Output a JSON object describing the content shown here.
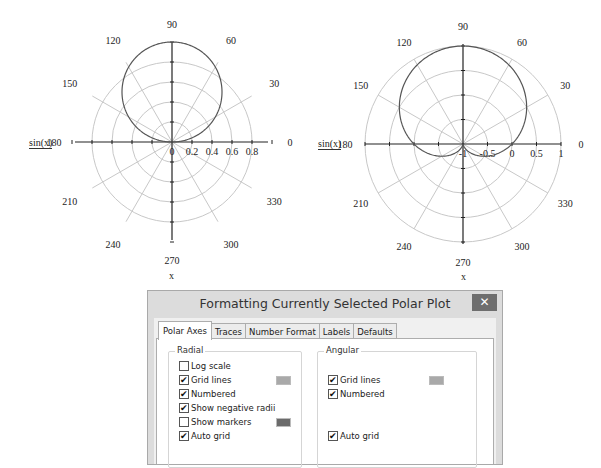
{
  "chart_data": [
    {
      "type": "polar-line",
      "title": "",
      "trace_label": "sin(x)",
      "angle_label": "x",
      "function": "r = sin(x)",
      "angular_ticks": [
        "0",
        "30",
        "60",
        "90",
        "120",
        "150",
        "180",
        "210",
        "240",
        "270",
        "300",
        "330"
      ],
      "radial_ticks": [
        "0",
        "0.2",
        "0.4",
        "0.6",
        "0.8"
      ],
      "rlim": [
        0,
        1
      ],
      "grid": true,
      "series": [
        {
          "name": "sin(x)",
          "theta_deg": [
            0,
            15,
            30,
            45,
            60,
            75,
            90,
            105,
            120,
            135,
            150,
            165,
            180
          ],
          "r": [
            0,
            0.259,
            0.5,
            0.707,
            0.866,
            0.966,
            1,
            0.966,
            0.866,
            0.707,
            0.5,
            0.259,
            0
          ]
        }
      ]
    },
    {
      "type": "polar-line",
      "title": "",
      "trace_label": "sin(x)",
      "angle_label": "x",
      "function": "r = sin(x), negative radii shown",
      "angular_ticks": [
        "0",
        "30",
        "60",
        "90",
        "120",
        "150",
        "180",
        "210",
        "240",
        "270",
        "300",
        "330"
      ],
      "radial_ticks": [
        "-1",
        "-0.5",
        "0",
        "0.5",
        "1"
      ],
      "rlim": [
        -1,
        1
      ],
      "grid": true,
      "series": [
        {
          "name": "sin(x)",
          "theta_deg": [
            0,
            30,
            60,
            90,
            120,
            150,
            180,
            210,
            240,
            270,
            300,
            330,
            360
          ],
          "r": [
            0,
            0.5,
            0.866,
            1,
            0.866,
            0.5,
            0,
            -0.5,
            -0.866,
            -1,
            -0.866,
            -0.5,
            0
          ]
        }
      ]
    }
  ],
  "plots": [
    {
      "trace_label": "sin(x)",
      "angle_label": "x"
    },
    {
      "trace_label": "sin(x)",
      "angle_label": "x"
    }
  ],
  "dialog": {
    "title": "Formatting Currently Selected Polar Plot",
    "close_label": "✕",
    "tabs": [
      {
        "label": "Polar Axes",
        "active": true
      },
      {
        "label": "Traces",
        "active": false
      },
      {
        "label": "Number Format",
        "active": false
      },
      {
        "label": "Labels",
        "active": false
      },
      {
        "label": "Defaults",
        "active": false
      }
    ],
    "radial": {
      "label": "Radial",
      "options": [
        {
          "label": "Log scale",
          "checked": false
        },
        {
          "label": "Grid lines",
          "checked": true,
          "swatch": "#a9a9a9"
        },
        {
          "label": "Numbered",
          "checked": true
        },
        {
          "label": "Show negative radii",
          "checked": true
        },
        {
          "label": "Show markers",
          "checked": false,
          "swatch": "#6b6b6b"
        },
        {
          "label": "Auto grid",
          "checked": true
        }
      ]
    },
    "angular": {
      "label": "Angular",
      "options": [
        {
          "label": "Grid lines",
          "checked": true,
          "swatch": "#a9a9a9"
        },
        {
          "label": "Numbered",
          "checked": true
        },
        {
          "label": "Auto grid",
          "checked": true
        }
      ]
    },
    "check_glyph": "✔"
  }
}
